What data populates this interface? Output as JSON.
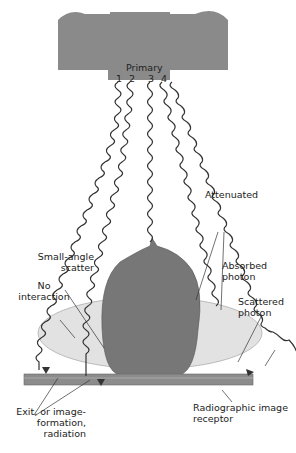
{
  "diagram": {
    "tube_label": "Primary",
    "photon_numbers": [
      "1",
      "2",
      "3",
      "4"
    ],
    "labels": {
      "attenuated": "Attenuated",
      "small_angle_scatter": [
        "Small-angle",
        "scatter"
      ],
      "no_interaction": [
        "No",
        "interaction"
      ],
      "absorbed_photon": [
        "Absorbed",
        "photon"
      ],
      "scattered_photon": [
        "Scattered",
        "photon"
      ],
      "exit_radiation": [
        "Exit, or image-",
        "formation,",
        "radiation"
      ],
      "image_receptor": [
        "Radiographic image",
        "receptor"
      ]
    },
    "colors": {
      "tube": "#8a8a8a",
      "patient_body": "#e2e2e2",
      "patient_head": "#7a7a7a",
      "receptor": "#8c8c8c",
      "photon_line": "#333333"
    }
  }
}
